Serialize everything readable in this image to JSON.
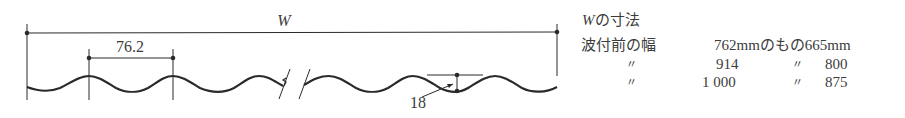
{
  "diagram": {
    "overall_width_label": "W",
    "pitch_label": "76.2",
    "depth_label": "18",
    "line_color": "#2a2a2a",
    "text_color": "#3c3c3c"
  },
  "table": {
    "title_var": "W",
    "title_rest": "の寸法",
    "row_header": "波付前の幅",
    "rows": [
      {
        "label": "",
        "before": "762mm",
        "connector": "のもの",
        "after": "665mm"
      },
      {
        "label": "〃",
        "before": "914",
        "connector": "〃",
        "after": "800"
      },
      {
        "label": "〃",
        "before": "1 000",
        "connector": "〃",
        "after": "875"
      }
    ]
  }
}
